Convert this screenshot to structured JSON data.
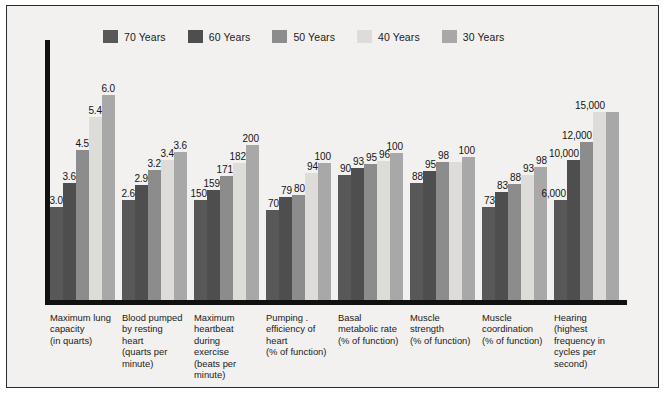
{
  "chart_data": {
    "type": "bar",
    "title": "",
    "xlabel": "",
    "ylabel": "",
    "grid": false,
    "legend_position": "top",
    "orientation": "vertical",
    "grouped": true,
    "categories": [
      "Maximum lung capacity (in quarts)",
      "Blood pumped by resting heart (quarts per minute)",
      "Maximum heartbeat during exercise (beats per minute)",
      "Pumping . efficiency of heart (% of function)",
      "Basal metabolic rate (% of function)",
      "Muscle strength (% of function)",
      "Muscle coordination (% of function)",
      "Hearing (highest frequency in cycles per second)"
    ],
    "category_lines": [
      [
        "Maximum lung",
        "capacity",
        "(in quarts)"
      ],
      [
        "Blood pumped",
        "by resting",
        "heart",
        "(quarts per",
        "minute)"
      ],
      [
        "Maximum",
        "heartbeat",
        "during",
        "exercise",
        "(beats per",
        "minute)"
      ],
      [
        "Pumping .",
        "efficiency of",
        "heart",
        "(% of function)"
      ],
      [
        "Basal",
        "metabolic rate",
        "(% of function)"
      ],
      [
        "Muscle",
        "strength",
        "(% of function)"
      ],
      [
        "Muscle",
        "coordination",
        "(% of function)"
      ],
      [
        "Hearing",
        "(highest",
        "frequency in",
        "cycles per",
        "second)"
      ]
    ],
    "series": [
      {
        "name": "70 Years",
        "color": "#585858",
        "values": [
          3.0,
          2.6,
          150,
          70,
          90,
          88,
          73,
          6000
        ],
        "labels": [
          "3.0",
          "2.6",
          "150",
          "70",
          "90",
          "88",
          "73",
          "6,000"
        ]
      },
      {
        "name": "60 Years",
        "color": "#4e4e4e",
        "values": [
          3.6,
          2.9,
          159,
          79,
          93,
          95,
          83,
          10000
        ],
        "labels": [
          "3.6",
          "2.9",
          "159",
          "79",
          "93",
          "95",
          "83",
          "10,000"
        ]
      },
      {
        "name": "50 Years",
        "color": "#8c8c8c",
        "values": [
          4.5,
          3.2,
          171,
          80,
          95,
          98,
          88,
          12000
        ],
        "labels": [
          "4.5",
          "3.2",
          "171",
          "80",
          "95",
          "98",
          "88",
          "12,000"
        ]
      },
      {
        "name": "40 Years",
        "color": "#dedcd8",
        "values": [
          5.4,
          3.4,
          182,
          94,
          96,
          98,
          93,
          15000
        ],
        "labels": [
          "5.4",
          "3.4",
          "182",
          "94",
          "96",
          "",
          "93",
          "15,000"
        ]
      },
      {
        "name": "30 Years",
        "color": "#a8a8a8",
        "values": [
          6.0,
          3.6,
          200,
          100,
          100,
          100,
          98,
          15000
        ],
        "labels": [
          "6.0",
          "3.6",
          "200",
          "100",
          "100",
          "100",
          "98",
          ""
        ]
      }
    ],
    "group_max": [
      6.0,
      3.6,
      200,
      100,
      100,
      100,
      98,
      15000
    ],
    "bar_pixel_heights": [
      [
        93,
        117,
        150,
        183,
        205
      ],
      [
        100,
        115,
        130,
        140,
        148
      ],
      [
        100,
        110,
        124,
        137,
        155
      ],
      [
        90,
        103,
        105,
        127,
        137
      ],
      [
        125,
        132,
        136,
        139,
        147
      ],
      [
        117,
        129,
        138,
        138,
        143
      ],
      [
        93,
        108,
        116,
        125,
        133
      ],
      [
        100,
        140,
        158,
        188,
        188
      ]
    ]
  },
  "legend": {
    "items": [
      {
        "label": "70 Years",
        "color": "#585858"
      },
      {
        "label": "60 Years",
        "color": "#4e4e4e"
      },
      {
        "label": "50 Years",
        "color": "#8c8c8c"
      },
      {
        "label": "40 Years",
        "color": "#dedcd8"
      },
      {
        "label": "30 Years",
        "color": "#a8a8a8"
      }
    ]
  },
  "axis": {
    "color": "#111111"
  }
}
